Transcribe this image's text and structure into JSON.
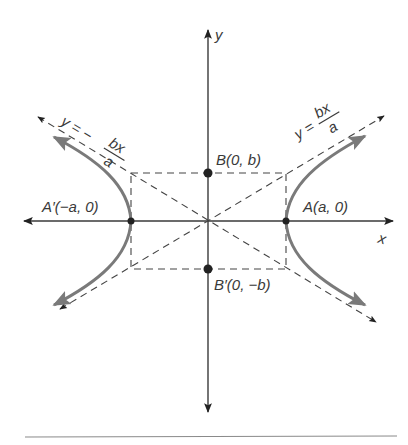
{
  "figure": {
    "axes": {
      "x_label": "x",
      "y_label": "y"
    },
    "points": [
      {
        "id": "A",
        "label": "A(a, 0)"
      },
      {
        "id": "A_prime",
        "label": "A′(−a, 0)"
      },
      {
        "id": "B",
        "label": "B(0, b)"
      },
      {
        "id": "B_prime",
        "label": "B′(0, −b)"
      }
    ],
    "asymptotes": [
      {
        "id": "positive",
        "lhs": "y =",
        "numerator": "bx",
        "denominator": "a"
      },
      {
        "id": "negative",
        "lhs": "y = −",
        "numerator": "bx",
        "denominator": "a"
      }
    ],
    "colors": {
      "axis": "#3a3a3a",
      "dashed": "#444444",
      "curve": "#7a7a7a",
      "point": "#222222",
      "rule": "#8a8a8a"
    }
  }
}
